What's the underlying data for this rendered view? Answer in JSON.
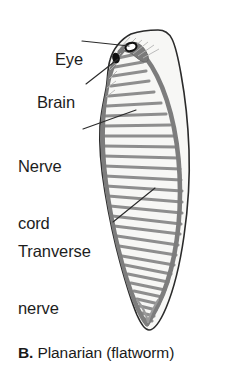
{
  "figure": {
    "caption_letter": "B.",
    "caption_text": "Planarian (flatworm)"
  },
  "labels": {
    "eye": "Eye",
    "brain": "Brain",
    "nerve_cord_line1": "Nerve",
    "nerve_cord_line2": "cord",
    "transverse_line1": "Tranverse",
    "transverse_line2": "nerve"
  },
  "colors": {
    "outline": "#2b2b2b",
    "nerve_tissue": "#8a8a8a",
    "nerve_tissue_dark": "#6f6f6f",
    "body_fill": "#f7f7f5",
    "eyespot": "#121212",
    "leader_line": "#2b2b2b",
    "text": "#1a1a1a",
    "background": "#ffffff"
  },
  "anatomy": {
    "eyespot_count": 2,
    "nerve_cord_count": 2,
    "transverse_nerve_count": 30
  }
}
